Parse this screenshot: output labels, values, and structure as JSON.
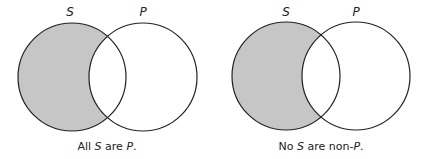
{
  "colors": {
    "shade": "#c6c6c6",
    "stroke": "#222222",
    "background": "#ffffff"
  },
  "diagrams": [
    {
      "circle_labels": {
        "left": "S",
        "right": "P"
      },
      "shaded_region": "S minus P",
      "caption": {
        "part1": "All ",
        "part2": "S",
        "part3": " are ",
        "part4": "P",
        "part5": "."
      }
    },
    {
      "circle_labels": {
        "left": "S",
        "right": "P"
      },
      "shaded_region": "S minus P",
      "caption": {
        "part1": "No ",
        "part2": "S",
        "part3": " are non-",
        "part4": "P",
        "part5": "."
      }
    }
  ]
}
